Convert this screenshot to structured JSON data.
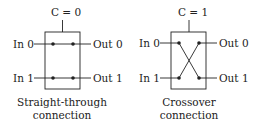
{
  "switches": [
    {
      "id": "straight",
      "control_label": "C = 0",
      "inputs": [
        "In 0",
        "In 1"
      ],
      "outputs": [
        "Out 0",
        "Out 1"
      ],
      "caption_line1": "Straight-through",
      "caption_line2": "connection"
    },
    {
      "id": "crossover",
      "control_label": "C = 1",
      "inputs": [
        "In 0",
        "In 1"
      ],
      "outputs": [
        "Out 0",
        "Out 1"
      ],
      "caption_line1": "Crossover",
      "caption_line2": "connection"
    }
  ],
  "colors": {
    "line": "#222222",
    "text": "#222222",
    "background": "#ffffff"
  }
}
